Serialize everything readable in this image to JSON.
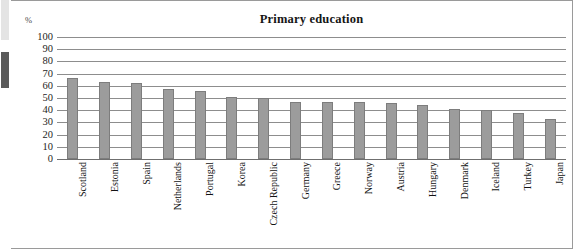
{
  "chart_data": {
    "type": "bar",
    "title": "Primary education",
    "xlabel": "",
    "ylabel": "%",
    "ylim": [
      0,
      100
    ],
    "ytick_step": 10,
    "yticks": [
      100,
      90,
      80,
      70,
      60,
      50,
      40,
      30,
      20,
      10,
      0
    ],
    "grid": true,
    "legend": "none",
    "bar_color": "#9c9c9c",
    "bar_border_color": "#7d7d7d",
    "categories": [
      "Scotland",
      "Estonia",
      "Spain",
      "Netherlands",
      "Portugal",
      "Korea",
      "Czech Republic",
      "Germany",
      "Greece",
      "Norway",
      "Austria",
      "Hungary",
      "Denmark",
      "Iceland",
      "Turkey",
      "Japan"
    ],
    "values": [
      66,
      63,
      62,
      57,
      56,
      51,
      50,
      47,
      47,
      47,
      46,
      44,
      41,
      40,
      38,
      33
    ]
  },
  "margin_marks": {
    "light_block": "#e4e4e4",
    "dark_block": "#5a5a5a"
  }
}
